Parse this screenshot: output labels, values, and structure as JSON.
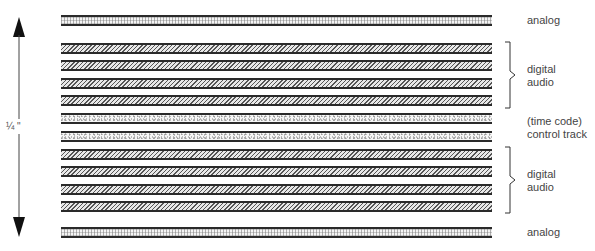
{
  "diagram": {
    "type": "tape-track-layout",
    "width_label": "¼ \"",
    "tracks": [
      {
        "kind": "analog",
        "top": 15,
        "height": 11
      },
      {
        "kind": "digital",
        "top": 43,
        "height": 11
      },
      {
        "kind": "digital",
        "top": 60,
        "height": 11
      },
      {
        "kind": "digital",
        "top": 78,
        "height": 11
      },
      {
        "kind": "digital",
        "top": 95,
        "height": 11
      },
      {
        "kind": "control",
        "top": 113,
        "height": 11
      },
      {
        "kind": "control",
        "top": 131,
        "height": 11
      },
      {
        "kind": "digital",
        "top": 149,
        "height": 11
      },
      {
        "kind": "digital",
        "top": 166,
        "height": 11
      },
      {
        "kind": "digital",
        "top": 184,
        "height": 11
      },
      {
        "kind": "digital",
        "top": 201,
        "height": 11
      },
      {
        "kind": "analog",
        "top": 227,
        "height": 11
      }
    ],
    "labels": {
      "analog_top": "analog",
      "digital_top_line1": "digital",
      "digital_top_line2": "audio",
      "control_line1": "(time code)",
      "control_line2": "control track",
      "digital_bottom_line1": "digital",
      "digital_bottom_line2": "audio",
      "analog_bottom": "analog"
    },
    "colors": {
      "track_border": "#2a2a2a",
      "text": "#444444",
      "background": "#ffffff"
    }
  }
}
